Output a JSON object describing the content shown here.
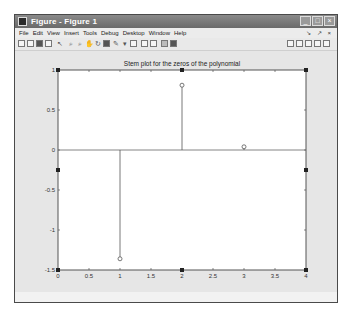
{
  "window": {
    "title": "Figure - Figure 1",
    "controls": {
      "minimize": "_",
      "maximize": "□",
      "close": "×"
    }
  },
  "menubar": {
    "items": [
      "File",
      "Edit",
      "View",
      "Insert",
      "Tools",
      "Debug",
      "Desktop",
      "Window",
      "Help"
    ],
    "dock_controls": "↘ ↗ ×"
  },
  "toolbar": {
    "left_icons": [
      "new-figure-icon",
      "open-file-icon",
      "save-icon",
      "print-icon",
      "edit-plot-arrow-icon",
      "zoom-in-icon",
      "zoom-out-icon",
      "pan-icon",
      "rotate-3d-icon",
      "data-cursor-icon",
      "brush-icon",
      "link-plot-icon",
      "insert-colorbar-icon",
      "insert-legend-icon",
      "hide-plot-tools-icon",
      "show-plot-tools-icon"
    ],
    "right_icons": [
      "tile-layout-icon",
      "left-right-layout-icon",
      "top-bottom-layout-icon",
      "float-icon",
      "maximize-icon"
    ]
  },
  "chart_data": {
    "type": "stem",
    "title": "Stem plot for the zeros of the polynomial",
    "xlabel": "",
    "ylabel": "",
    "xlim": [
      0,
      4
    ],
    "ylim": [
      -1.5,
      1
    ],
    "xticks": [
      "0",
      "0.5",
      "1",
      "1.5",
      "2",
      "2.5",
      "3",
      "3.5",
      "4"
    ],
    "yticks": [
      "1",
      "0.5",
      "0",
      "-0.5",
      "-1",
      "-1.5"
    ],
    "grid": false,
    "series": [
      {
        "name": "zeros",
        "x": [
          1,
          2,
          3
        ],
        "y": [
          -1.36,
          0.81,
          0.04
        ],
        "marker": "circle"
      }
    ],
    "baseline": 0
  },
  "colors": {
    "titlebar": "#7a7a7a",
    "figure_bg": "#e6e6e6",
    "axes_bg": "#ffffff",
    "stem": "#555555"
  }
}
